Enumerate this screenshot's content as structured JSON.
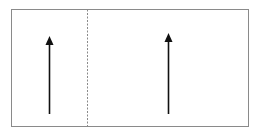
{
  "diagram": {
    "frame": {
      "x": 11,
      "y": 9,
      "width": 237,
      "height": 117,
      "stroke": "#8a8a8a"
    },
    "divider": {
      "x": 87,
      "style": "dashed",
      "stroke": "#8a8a8a"
    },
    "arrows": [
      {
        "name": "left-arrow",
        "x": 49,
        "y_start": 114,
        "y_end": 36,
        "direction": "up",
        "color": "#111111"
      },
      {
        "name": "right-arrow",
        "x": 168,
        "y_start": 114,
        "y_end": 33,
        "direction": "up",
        "color": "#111111"
      }
    ]
  }
}
